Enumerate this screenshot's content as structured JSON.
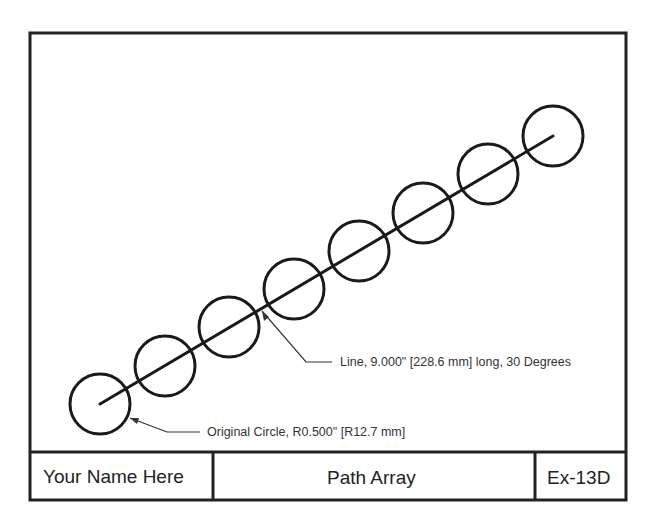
{
  "drawing": {
    "border_color": "#222222",
    "stroke_color": "#1a1a1a",
    "line": {
      "x1": 100,
      "y1": 404,
      "x2": 553,
      "y2": 136
    },
    "circle_radius": 30,
    "circles": [
      {
        "cx": 100,
        "cy": 404
      },
      {
        "cx": 165,
        "cy": 366
      },
      {
        "cx": 229,
        "cy": 327
      },
      {
        "cx": 294,
        "cy": 289
      },
      {
        "cx": 359,
        "cy": 251
      },
      {
        "cx": 423,
        "cy": 213
      },
      {
        "cx": 488,
        "cy": 174
      },
      {
        "cx": 553,
        "cy": 136
      }
    ],
    "annotations": {
      "line_note": "Line,  9.000\" [228.6 mm] long, 30 Degrees",
      "circle_note": "Original Circle,  R0.500\" [R12.7 mm]"
    }
  },
  "title_block": {
    "name": "Your Name Here",
    "title": "Path Array",
    "number": "Ex-13D"
  }
}
